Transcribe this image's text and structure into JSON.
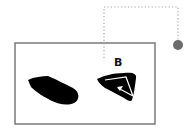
{
  "diagram": {
    "frame": {
      "x": 14,
      "y": 42,
      "width": 141,
      "height": 82,
      "stroke": "#7a7a7a"
    },
    "connector": {
      "style": "dotted",
      "color": "#a8a8a8",
      "points": [
        [
          104,
          58
        ],
        [
          104,
          7
        ],
        [
          178,
          7
        ],
        [
          178,
          40
        ]
      ]
    },
    "endpoint": {
      "cx": 178,
      "cy": 45,
      "r": 5,
      "fill": "#6b6b6b"
    },
    "shapes": [
      {
        "id": "A",
        "label": "",
        "fill": "#000000"
      },
      {
        "id": "B",
        "label": "B",
        "fill": "#000000",
        "arrow_color": "#ffffff"
      }
    ],
    "labels": {
      "b": "B"
    }
  }
}
